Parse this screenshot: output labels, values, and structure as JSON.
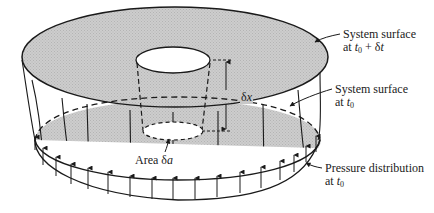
{
  "figure": {
    "type": "fluid system control volume diagram",
    "colors": {
      "surface_fill": "#c9c9c9",
      "stroke": "#1a1a1a",
      "background": "#ffffff",
      "hole_fill": "#ffffff"
    }
  },
  "labels": {
    "surface_t0_dt": {
      "line1": "System surface",
      "line2_prefix": "at ",
      "t": "t",
      "sub": "0",
      "suffix": " + δ",
      "dt": "t"
    },
    "surface_t0": {
      "line1": "System surface",
      "line2_prefix": "at ",
      "t": "t",
      "sub": "0"
    },
    "pressure": {
      "line1": "Pressure distribution",
      "line2_prefix": "at ",
      "t": "t",
      "sub": "0"
    },
    "area": {
      "prefix": "Area δ",
      "var": "a"
    },
    "dx": {
      "prefix": "δ",
      "var": "x"
    }
  }
}
